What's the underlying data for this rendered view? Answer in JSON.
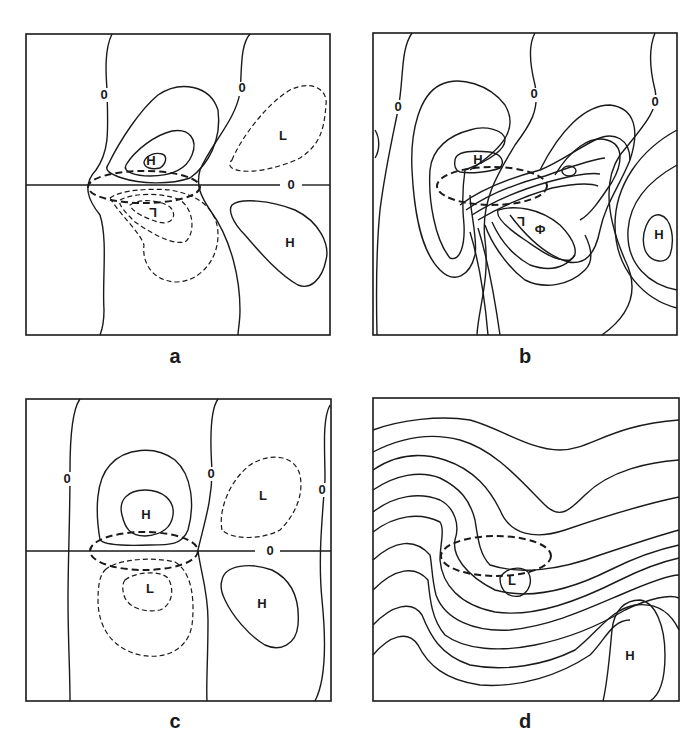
{
  "figure": {
    "panels": [
      {
        "id": "a",
        "caption": "a",
        "labels": {
          "high_upper": "H",
          "low_upper_right": "L",
          "low_center": "L",
          "high_lower_right": "H"
        },
        "zero_labels": [
          "0",
          "0",
          "0"
        ],
        "contour_styles": {
          "positive": "solid",
          "negative": "dashed"
        }
      },
      {
        "id": "b",
        "caption": "b",
        "labels": {
          "high_center": "H",
          "low_center": "L",
          "high_right": "H"
        },
        "zero_labels": [
          "0",
          "0",
          "0"
        ]
      },
      {
        "id": "c",
        "caption": "c",
        "labels": {
          "high_upper": "H",
          "low_upper_right": "L",
          "low_center": "L",
          "high_lower_right": "H"
        },
        "zero_labels": [
          "0",
          "0",
          "0",
          "0"
        ],
        "contour_styles": {
          "positive": "solid",
          "negative": "dashed"
        }
      },
      {
        "id": "d",
        "caption": "d",
        "labels": {
          "low_center": "L",
          "high_lower_right": "H"
        }
      }
    ],
    "colors": {
      "ink": "#1a1a1a",
      "background": "#ffffff"
    }
  }
}
